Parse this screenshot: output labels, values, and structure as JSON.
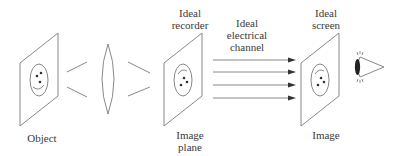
{
  "diagram": {
    "type": "optical-imaging-chain",
    "stroke_color": "#7a7a7a",
    "text_color": "#3a3a3a",
    "labels": {
      "object": "Object",
      "recorder_line1": "Ideal",
      "recorder_line2": "recorder",
      "channel_line1": "Ideal",
      "channel_line2": "electrical",
      "channel_line3": "channel",
      "screen_line1": "Ideal",
      "screen_line2": "screen",
      "image_plane_line1": "Image",
      "image_plane_line2": "plane",
      "image": "Image"
    },
    "nodes": [
      {
        "id": "object-plane",
        "label": "Object",
        "content": "smiley face (right-side up)"
      },
      {
        "id": "lens",
        "label": "",
        "content": "biconvex lens"
      },
      {
        "id": "recorder-plane",
        "label": "Ideal recorder / Image plane",
        "content": "inverted face"
      },
      {
        "id": "channel",
        "label": "Ideal electrical channel",
        "content": "4 parallel arrows"
      },
      {
        "id": "screen-plane",
        "label": "Ideal screen / Image",
        "content": "inverted face"
      },
      {
        "id": "observer-eye",
        "label": "",
        "content": "eye viewing screen"
      }
    ],
    "edges": [
      {
        "from": "object-plane",
        "to": "lens",
        "style": "converging rays"
      },
      {
        "from": "lens",
        "to": "recorder-plane",
        "style": "converging rays"
      },
      {
        "from": "recorder-plane",
        "to": "screen-plane",
        "style": "4 arrows"
      },
      {
        "from": "screen-plane",
        "to": "observer-eye",
        "style": "viewing"
      }
    ],
    "channel_arrow_count": 4
  }
}
